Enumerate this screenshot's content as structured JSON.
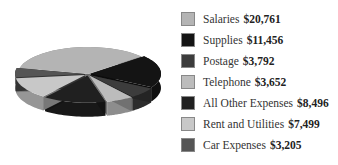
{
  "chart_data": {
    "type": "pie",
    "title": "",
    "style": "3d-exploded",
    "categories": [
      "Salaries",
      "Supplies",
      "Postage",
      "Telephone",
      "All Other Expenses",
      "Rent and Utilities",
      "Car Expenses"
    ],
    "values": [
      20761,
      11456,
      3792,
      3652,
      8496,
      7499,
      3205
    ],
    "value_labels": [
      "$20,761",
      "$11,456",
      "$3,792",
      "$3,652",
      "$8,496",
      "$7,499",
      "$3,205"
    ],
    "colors": [
      "#b4b4b4",
      "#141414",
      "#3c3c3c",
      "#bcbcbc",
      "#202020",
      "#c8c8c8",
      "#555555"
    ],
    "legend_position": "right"
  },
  "legend": {
    "items": [
      {
        "label": "Salaries",
        "value": "$20,761",
        "color": "#b4b4b4"
      },
      {
        "label": "Supplies",
        "value": "$11,456",
        "color": "#141414"
      },
      {
        "label": "Postage",
        "value": "$3,792",
        "color": "#3c3c3c"
      },
      {
        "label": "Telephone",
        "value": "$3,652",
        "color": "#bcbcbc"
      },
      {
        "label": "All Other Expenses",
        "value": "$8,496",
        "color": "#202020"
      },
      {
        "label": "Rent and Utilities",
        "value": "$7,499",
        "color": "#c8c8c8"
      },
      {
        "label": "Car Expenses",
        "value": "$3,205",
        "color": "#555555"
      }
    ]
  }
}
